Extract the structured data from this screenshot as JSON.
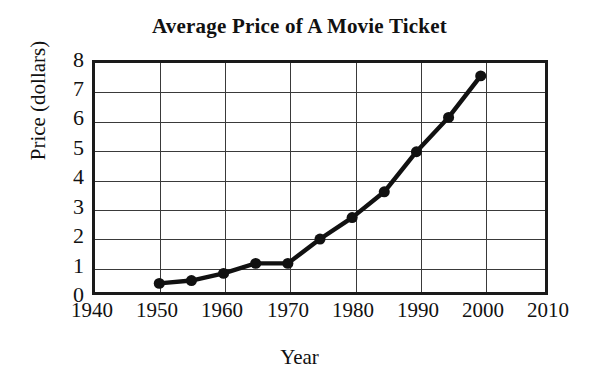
{
  "chart_data": {
    "type": "line",
    "title": "Average Price of A Movie Ticket",
    "xlabel": "Year",
    "ylabel": "Price (dollars)",
    "xlim": [
      1940,
      2010
    ],
    "ylim": [
      0,
      8
    ],
    "xticks": [
      1940,
      1950,
      1960,
      1970,
      1980,
      1990,
      2000,
      2010
    ],
    "yticks": [
      0,
      1,
      2,
      3,
      4,
      5,
      6,
      7,
      8
    ],
    "grid": true,
    "legend": null,
    "series": [
      {
        "name": "Average ticket price",
        "x": [
          1950,
          1955,
          1960,
          1965,
          1970,
          1975,
          1980,
          1985,
          1990,
          1995,
          2000
        ],
        "values": [
          0.3,
          0.4,
          0.65,
          1.0,
          1.0,
          1.85,
          2.6,
          3.5,
          4.9,
          6.1,
          7.55
        ],
        "marker": "filled-circle",
        "color": "#111111"
      }
    ]
  },
  "axes": {
    "y_tick_labels": [
      "8",
      "7",
      "6",
      "5",
      "4",
      "3",
      "2",
      "1",
      "0"
    ],
    "x_tick_labels": [
      "1940",
      "1950",
      "1960",
      "1970",
      "1980",
      "1990",
      "2000",
      "2010"
    ]
  },
  "colors": {
    "line": "#111111",
    "marker": "#111111",
    "grid": "#3a3a3a",
    "frame": "#1a1a1a",
    "background": "#ffffff"
  }
}
